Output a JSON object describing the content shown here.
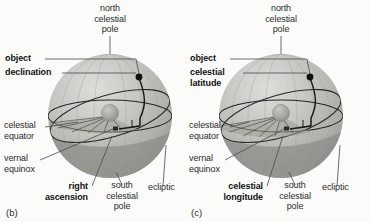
{
  "figure": {
    "background_color": "#fbfbfa"
  },
  "colors": {
    "sphere_light": "#cfcfcb",
    "sphere_mid": "#b3b3ae",
    "sphere_dark": "#9a9a95",
    "lower_hemisphere": "#8f8f8a",
    "line_dark": "#1d1d1d",
    "line_mid": "#4a4a4a",
    "text": "#2b2b2b",
    "earth": "#a8a8a3"
  },
  "panels": [
    {
      "tag": "(b)",
      "system": "equatorial",
      "labels": {
        "north_pole": "north\ncelestial\npole",
        "object": "object",
        "angle_from_equator": "declination",
        "equator": "celestial\nequator",
        "vernal_equinox": "vernal\nequinox",
        "longitude_angle": "right\nascension",
        "south_pole": "south\ncelestial\npole",
        "ecliptic": "ecliptic"
      }
    },
    {
      "tag": "(c)",
      "system": "ecliptic",
      "labels": {
        "north_pole": "north\ncelestial\npole",
        "object": "object",
        "angle_from_equator": "celestial\nlatitude",
        "equator": "celestial\nequator",
        "vernal_equinox": "vernal\nequinox",
        "longitude_angle": "celestial\nlongitude",
        "south_pole": "south\ncelestial\npole",
        "ecliptic": "ecliptic"
      }
    }
  ]
}
